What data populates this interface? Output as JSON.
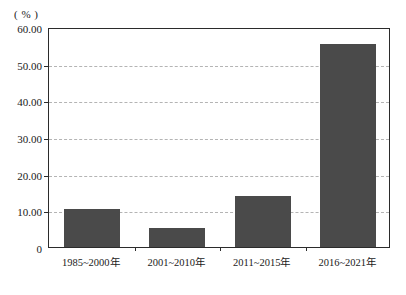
{
  "chart_data": {
    "type": "bar",
    "title": "",
    "subtitle": "",
    "xlabel": "",
    "ylabel": "",
    "unit_label": "( % )",
    "categories": [
      "1985~2000年",
      "2001~2010年",
      "2011~2015年",
      "2016~2021年"
    ],
    "values": [
      10.4,
      5.2,
      14.0,
      55.5
    ],
    "series": [
      {
        "name": "",
        "values": [
          10.4,
          5.2,
          14.0,
          55.5
        ]
      }
    ],
    "ylim": [
      0,
      60
    ],
    "yticks": [
      0,
      10,
      20,
      30,
      40,
      50,
      60
    ],
    "ytick_labels": [
      "0",
      "10.00",
      "20.00",
      "30.00",
      "40.00",
      "50.00",
      "60.00"
    ],
    "gridlines_at": [
      10,
      20,
      30,
      40,
      50
    ],
    "grid": true,
    "legend": "none",
    "bar_color": "#4a4a4a",
    "grid_color": "#b4b4b4",
    "axis_color": "#2b2b2b",
    "background_color": "#ffffff"
  }
}
